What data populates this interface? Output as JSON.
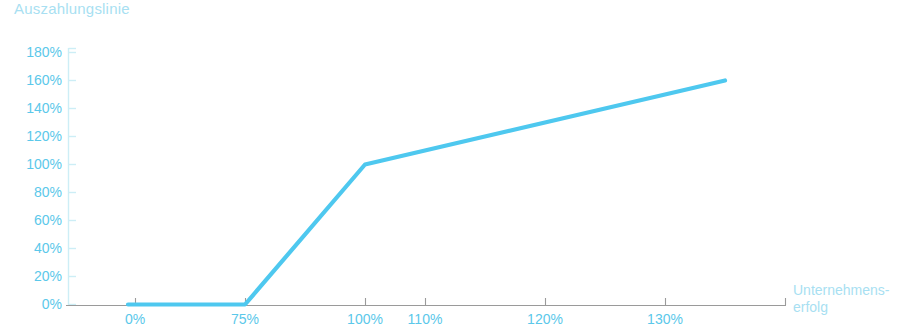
{
  "chart_data": {
    "type": "line",
    "title": "Auszahlungslinie",
    "xlabel": "Unternehmens-\nerfolg",
    "ylabel": "",
    "xlabel_line1": "Unternehmens-",
    "xlabel_line2": "erfolg",
    "x_tick_labels": [
      "0%",
      "75%",
      "100%",
      "110%",
      "120%",
      "130%"
    ],
    "x_tick_values": [
      0,
      75,
      100,
      110,
      120,
      130
    ],
    "y_tick_labels": [
      "180%",
      "160%",
      "140%",
      "120%",
      "100%",
      "80%",
      "60%",
      "40%",
      "20%",
      "0%"
    ],
    "y_tick_values": [
      180,
      160,
      140,
      120,
      100,
      80,
      60,
      40,
      20,
      0
    ],
    "ylim": [
      0,
      180
    ],
    "grid": false,
    "legend": false,
    "series": [
      {
        "name": "Auszahlungslinie",
        "color": "#4ec8ef",
        "points": [
          {
            "x": 0,
            "y": 0
          },
          {
            "x": 75,
            "y": 0
          },
          {
            "x": 100,
            "y": 100
          },
          {
            "x": 130,
            "y": 160
          }
        ]
      }
    ],
    "colors": {
      "line": "#4ec8ef",
      "tick_label": "#5bc8ea",
      "title": "#a8dff2",
      "axis_caption": "#a8dff2",
      "axis_line": "#9a9a9a",
      "y_axis_line": "#cdeef6",
      "background": "#ffffff"
    }
  }
}
